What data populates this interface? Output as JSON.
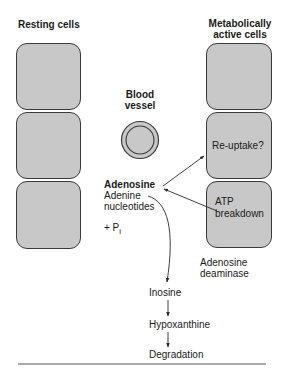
{
  "headings": {
    "resting": "Resting cells",
    "active_line1": "Metabolically",
    "active_line2": "active cells",
    "vessel_line1": "Blood",
    "vessel_line2": "vessel"
  },
  "cells": {
    "resting": [
      "",
      "",
      ""
    ],
    "active": [
      "",
      "Re-uptake?",
      "ATP breakdown"
    ]
  },
  "active_cell_text": {
    "reuptake": "Re-uptake?",
    "atp_line1": "ATP",
    "atp_line2": "breakdown"
  },
  "center": {
    "adenosine": "Adenosine",
    "nucleotides_line1": "Adenine",
    "nucleotides_line2": "nucleotides",
    "phosphate": "+ P",
    "phosphate_sub": "i"
  },
  "enzyme": {
    "line1": "Adenosine",
    "line2": "deaminase"
  },
  "pathway": [
    "Inosine",
    "Hypoxanthine",
    "Degradation"
  ],
  "colors": {
    "cell_fill": "#c8c8c8",
    "stroke": "#3a3a3a",
    "text": "#1a1a1a"
  }
}
